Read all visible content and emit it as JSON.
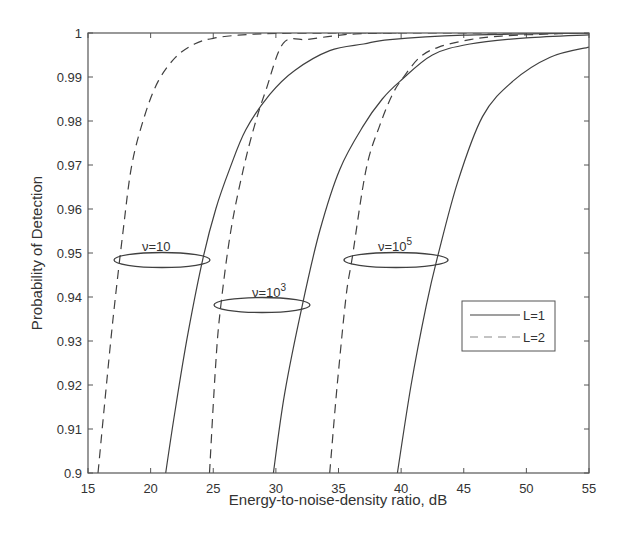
{
  "chart_data": {
    "type": "line",
    "title": "",
    "xlabel": "Energy-to-noise-density ratio, dB",
    "ylabel": "Probability of Detection",
    "xlim": [
      15,
      55
    ],
    "ylim": [
      0.9,
      1.0
    ],
    "xticks": [
      15,
      20,
      25,
      30,
      35,
      40,
      45,
      50,
      55
    ],
    "yticks": [
      0.9,
      0.91,
      0.92,
      0.93,
      0.94,
      0.95,
      0.96,
      0.97,
      0.98,
      0.99,
      1
    ],
    "ytick_labels": [
      "0.9",
      "0.91",
      "0.92",
      "0.93",
      "0.94",
      "0.95",
      "0.96",
      "0.97",
      "0.98",
      "0.99",
      "1"
    ],
    "grid": false,
    "legend": {
      "position": "inside-right",
      "entries": [
        {
          "label": "L=1",
          "style": "solid"
        },
        {
          "label": "L=2",
          "style": "dashed"
        }
      ]
    },
    "series": [
      {
        "name": "ν=10, L=2",
        "style": "dashed",
        "x": [
          15.8,
          16.3,
          17.0,
          17.8,
          18.5,
          19.5,
          20.6,
          22.0,
          23.5,
          25.0,
          27.0,
          30.0,
          35.0,
          40.0
        ],
        "y": [
          0.9,
          0.915,
          0.935,
          0.955,
          0.97,
          0.981,
          0.989,
          0.9945,
          0.9975,
          0.9988,
          0.9995,
          0.9999,
          1.0,
          1.0
        ]
      },
      {
        "name": "ν=10, L=1",
        "style": "solid",
        "x": [
          21.2,
          22.0,
          23.0,
          24.2,
          25.2,
          26.3,
          27.6,
          29.5,
          31.5,
          34.3,
          37.0,
          39.1,
          45.0,
          55.0
        ],
        "y": [
          0.9,
          0.915,
          0.932,
          0.949,
          0.96,
          0.969,
          0.978,
          0.986,
          0.9915,
          0.996,
          0.9975,
          0.9985,
          0.9995,
          1.0
        ],
        "annotation": "ν=10"
      },
      {
        "name": "ν=10³, L=2",
        "style": "dashed",
        "x": [
          24.7,
          25.2,
          25.6,
          26.4,
          27.4,
          28.3,
          29.2,
          30.6,
          32.5,
          34.5,
          36.4,
          40.0,
          45.0,
          55.0
        ],
        "y": [
          0.9,
          0.925,
          0.938,
          0.955,
          0.969,
          0.979,
          0.987,
          0.9977,
          0.9985,
          0.9993,
          0.9998,
          1.0,
          1.0,
          1.0
        ]
      },
      {
        "name": "ν=10³, L=1",
        "style": "solid",
        "x": [
          29.8,
          30.7,
          32.1,
          33.5,
          35.1,
          37.0,
          38.5,
          39.9,
          42.5,
          45.5,
          50.0,
          55.0
        ],
        "y": [
          0.9,
          0.918,
          0.938,
          0.955,
          0.969,
          0.979,
          0.985,
          0.989,
          0.995,
          0.9975,
          0.9989,
          0.9996
        ],
        "annotation": "ν=10³"
      },
      {
        "name": "ν=10⁵, L=2",
        "style": "dashed",
        "x": [
          34.3,
          34.9,
          35.6,
          36.1,
          37.2,
          38.3,
          39.3,
          40.2,
          41.5,
          43.0,
          45.5,
          48.0,
          52.0,
          55.0
        ],
        "y": [
          0.9,
          0.92,
          0.94,
          0.949,
          0.969,
          0.979,
          0.986,
          0.99,
          0.9945,
          0.9968,
          0.9985,
          0.9993,
          0.9998,
          1.0
        ]
      },
      {
        "name": "ν=10⁵, L=1",
        "style": "solid",
        "x": [
          39.7,
          40.8,
          42.0,
          42.9,
          44.5,
          46.5,
          48.9,
          51.9,
          55.0
        ],
        "y": [
          0.9,
          0.92,
          0.938,
          0.949,
          0.966,
          0.981,
          0.989,
          0.9945,
          0.9968
        ],
        "annotation": "ν=10⁵"
      }
    ],
    "annotations": [
      {
        "text": "ν=10",
        "ellipse_center": [
          20.9,
          0.9483
        ]
      },
      {
        "text": "ν=10³",
        "ellipse_center": [
          29.9,
          0.938
        ]
      },
      {
        "text": "ν=10⁵",
        "ellipse_center": [
          39.6,
          0.9483
        ]
      }
    ]
  },
  "labels": {
    "xlabel": "Energy-to-noise-density ratio, dB",
    "ylabel": "Probability of Detection",
    "legend_l1": "L=1",
    "legend_l2": "L=2",
    "anno1": "ν=10",
    "anno2_base": "ν=10",
    "anno2_exp": "3",
    "anno3_base": "ν=10",
    "anno3_exp": "5"
  },
  "colors": {
    "line": "#404040",
    "axis": "#555555",
    "text": "#333333"
  }
}
